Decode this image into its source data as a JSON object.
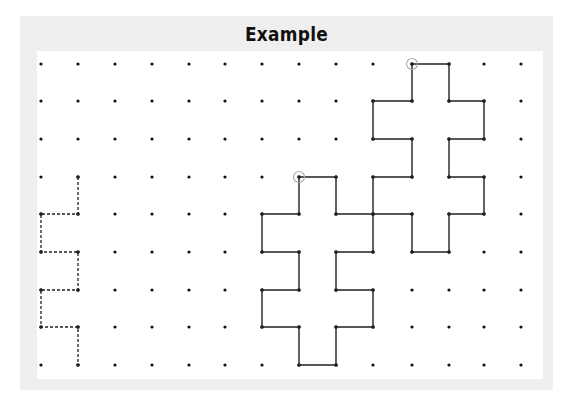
{
  "title": "Example",
  "grid": {
    "columns": 14,
    "rows": 9,
    "x_positions": [
      41,
      78,
      115,
      152,
      189,
      225,
      262,
      299,
      336,
      373,
      412,
      449,
      484,
      521
    ],
    "y_positions": [
      64,
      101,
      139,
      177,
      214,
      252,
      290,
      327,
      365
    ],
    "dot_color": "#111111"
  },
  "paths": [
    {
      "name": "dashed-staircase",
      "style": "dashed",
      "closed": false,
      "points": [
        [
          1,
          3
        ],
        [
          1,
          4
        ],
        [
          0,
          4
        ],
        [
          0,
          5
        ],
        [
          1,
          5
        ],
        [
          1,
          6
        ],
        [
          0,
          6
        ],
        [
          0,
          7
        ],
        [
          1,
          7
        ],
        [
          1,
          8
        ]
      ]
    },
    {
      "name": "lower-cross-shape",
      "style": "solid",
      "closed": true,
      "start_marker": [
        7,
        3
      ],
      "points": [
        [
          7,
          3
        ],
        [
          8,
          3
        ],
        [
          8,
          4
        ],
        [
          9,
          4
        ],
        [
          9,
          5
        ],
        [
          8,
          5
        ],
        [
          8,
          6
        ],
        [
          9,
          6
        ],
        [
          9,
          7
        ],
        [
          8,
          7
        ],
        [
          8,
          8
        ],
        [
          7,
          8
        ],
        [
          7,
          7
        ],
        [
          6,
          7
        ],
        [
          6,
          6
        ],
        [
          7,
          6
        ],
        [
          7,
          5
        ],
        [
          6,
          5
        ],
        [
          6,
          4
        ],
        [
          7,
          4
        ]
      ]
    },
    {
      "name": "upper-cross-shape",
      "style": "solid",
      "closed": true,
      "start_marker": [
        10,
        0
      ],
      "points": [
        [
          10,
          0
        ],
        [
          11,
          0
        ],
        [
          11,
          1
        ],
        [
          12,
          1
        ],
        [
          12,
          2
        ],
        [
          11,
          2
        ],
        [
          11,
          3
        ],
        [
          12,
          3
        ],
        [
          12,
          4
        ],
        [
          11,
          4
        ],
        [
          11,
          5
        ],
        [
          10,
          5
        ],
        [
          10,
          4
        ],
        [
          9,
          4
        ],
        [
          9,
          3
        ],
        [
          10,
          3
        ],
        [
          10,
          2
        ],
        [
          9,
          2
        ],
        [
          9,
          1
        ],
        [
          10,
          1
        ]
      ]
    }
  ],
  "colors": {
    "frame": "#efefef",
    "panel": "#ffffff",
    "line": "#222222",
    "marker": "#aaaaaa"
  }
}
